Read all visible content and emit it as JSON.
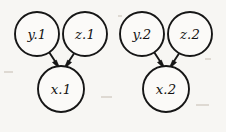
{
  "diagram": {
    "type": "directed-acyclic-graph",
    "background_color": "#f7f6f3",
    "stroke_color": "#161616",
    "node_fill_color": "#fbfaf8",
    "nodes": [
      {
        "id": "y1",
        "label": "y.1",
        "cx": 37,
        "cy": 34,
        "r": 22
      },
      {
        "id": "z1",
        "label": "z.1",
        "cx": 85,
        "cy": 34,
        "r": 22
      },
      {
        "id": "y2",
        "label": "y.2",
        "cx": 142,
        "cy": 34,
        "r": 22
      },
      {
        "id": "z2",
        "label": "z.2",
        "cx": 190,
        "cy": 34,
        "r": 22
      },
      {
        "id": "x1",
        "label": "x.1",
        "cx": 61,
        "cy": 89,
        "r": 23
      },
      {
        "id": "x2",
        "label": "x.2",
        "cx": 166,
        "cy": 89,
        "r": 23
      }
    ],
    "edges": [
      {
        "from": "y1",
        "to": "x1",
        "x1": 49,
        "y1": 52,
        "x2": 57,
        "y2": 66
      },
      {
        "from": "z1",
        "to": "x1",
        "x1": 76,
        "y1": 52,
        "x2": 67,
        "y2": 66
      },
      {
        "from": "y2",
        "to": "x2",
        "x1": 154,
        "y1": 52,
        "x2": 162,
        "y2": 66
      },
      {
        "from": "z2",
        "to": "x2",
        "x1": 181,
        "y1": 52,
        "x2": 172,
        "y2": 66
      }
    ]
  }
}
